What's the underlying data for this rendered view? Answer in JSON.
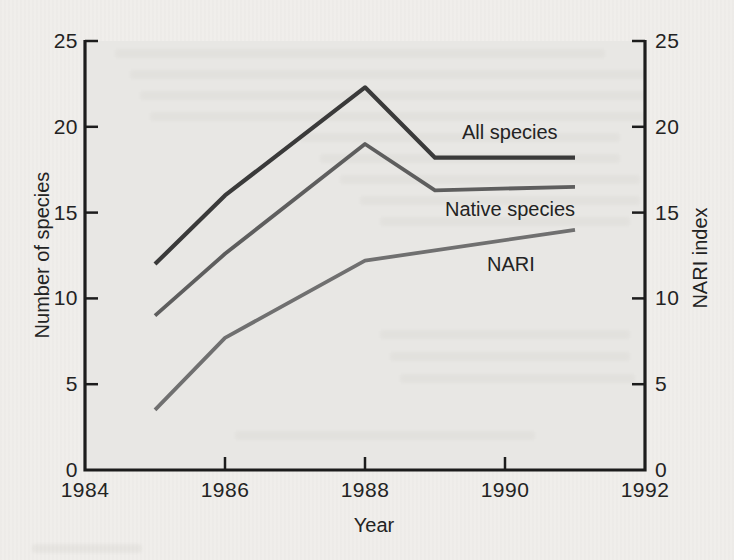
{
  "figure": {
    "x_axis_title": "Year",
    "left_axis_title": "Number of species",
    "right_axis_title": "NARI index"
  },
  "colors": {
    "page_bg": "#f0eeeb",
    "plot_bg": "#e8e7e4",
    "axis": "#1c1c1c",
    "text": "#232323",
    "all_species_line": "#3a3a3a",
    "native_species_line": "#5e5e5e",
    "nari_line": "#707070"
  },
  "chart_data": {
    "type": "line",
    "title": "",
    "xlabel": "Year",
    "ylabel_left": "Number of species",
    "ylabel_right": "NARI index",
    "xlim": [
      1984,
      1992
    ],
    "ylim": [
      0,
      25
    ],
    "x_ticks": [
      1984,
      1986,
      1988,
      1990,
      1992
    ],
    "y_ticks_left": [
      0,
      5,
      10,
      15,
      20,
      25
    ],
    "y_ticks_right": [
      0,
      5,
      10,
      15,
      20,
      25
    ],
    "grid": false,
    "legend_position": "inline-labels",
    "series": [
      {
        "name": "All species",
        "axis": "left",
        "color": "#3a3a3a",
        "stroke_width": 4.2,
        "points": [
          [
            1985,
            12
          ],
          [
            1986,
            16
          ],
          [
            1988,
            22.3
          ],
          [
            1989,
            18.2
          ],
          [
            1991,
            18.2
          ]
        ]
      },
      {
        "name": "Native species",
        "axis": "left",
        "color": "#5e5e5e",
        "stroke_width": 3.8,
        "points": [
          [
            1985,
            9
          ],
          [
            1986,
            12.6
          ],
          [
            1988,
            19
          ],
          [
            1989,
            16.3
          ],
          [
            1991,
            16.5
          ]
        ]
      },
      {
        "name": "NARI",
        "axis": "right",
        "color": "#707070",
        "stroke_width": 3.8,
        "points": [
          [
            1985,
            3.5
          ],
          [
            1986,
            7.7
          ],
          [
            1988,
            12.2
          ],
          [
            1991,
            14
          ]
        ]
      }
    ]
  }
}
